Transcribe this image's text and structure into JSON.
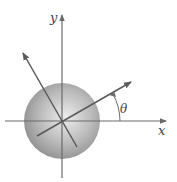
{
  "diagram": {
    "title": "",
    "axes": {
      "x_label": "x",
      "y_label": "y"
    },
    "angle_label": "θ",
    "colors": {
      "axis": "#6b6b6b",
      "sphere_light": "#e6e6e6",
      "sphere_dark": "#8f8f8f",
      "arrow": "#5a5a5a"
    },
    "elements": [
      {
        "type": "sphere",
        "description": "shaded gray sphere centered at origin"
      },
      {
        "type": "axis",
        "name": "x-axis",
        "direction": "right"
      },
      {
        "type": "axis",
        "name": "y-axis",
        "direction": "up"
      },
      {
        "type": "rotated-axis",
        "name": "x-prime",
        "angle_from_x_deg": 28
      },
      {
        "type": "rotated-axis",
        "name": "y-prime",
        "angle_from_y_deg": 28
      },
      {
        "type": "angle-arc",
        "label": "θ",
        "between": [
          "x-axis",
          "x-prime"
        ]
      }
    ]
  }
}
